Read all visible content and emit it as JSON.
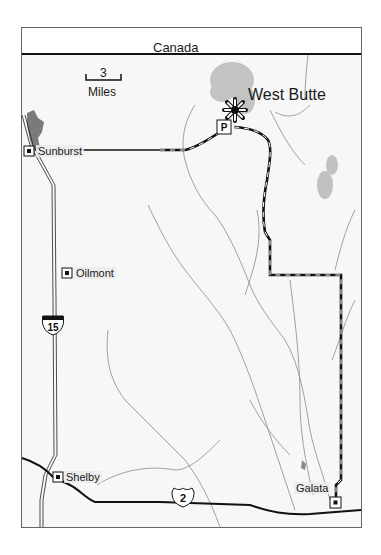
{
  "map": {
    "border_label": "Canada",
    "scale": {
      "value": "3",
      "unit": "Miles"
    },
    "peak": {
      "name": "West Butte",
      "icon": "peak-star-icon"
    },
    "parking": {
      "label": "P",
      "icon": "parking-icon"
    },
    "towns": [
      {
        "name": "Sunburst"
      },
      {
        "name": "Oilmont"
      },
      {
        "name": "Shelby"
      },
      {
        "name": "Galata"
      }
    ],
    "highways": [
      {
        "type": "interstate",
        "number": "15"
      },
      {
        "type": "us-route",
        "number": "2"
      }
    ],
    "colors": {
      "frame": "#555555",
      "road": "#111111",
      "river": "#8a8a8a",
      "water": "#7a7a7a",
      "relief": "#b0b0b0"
    }
  }
}
